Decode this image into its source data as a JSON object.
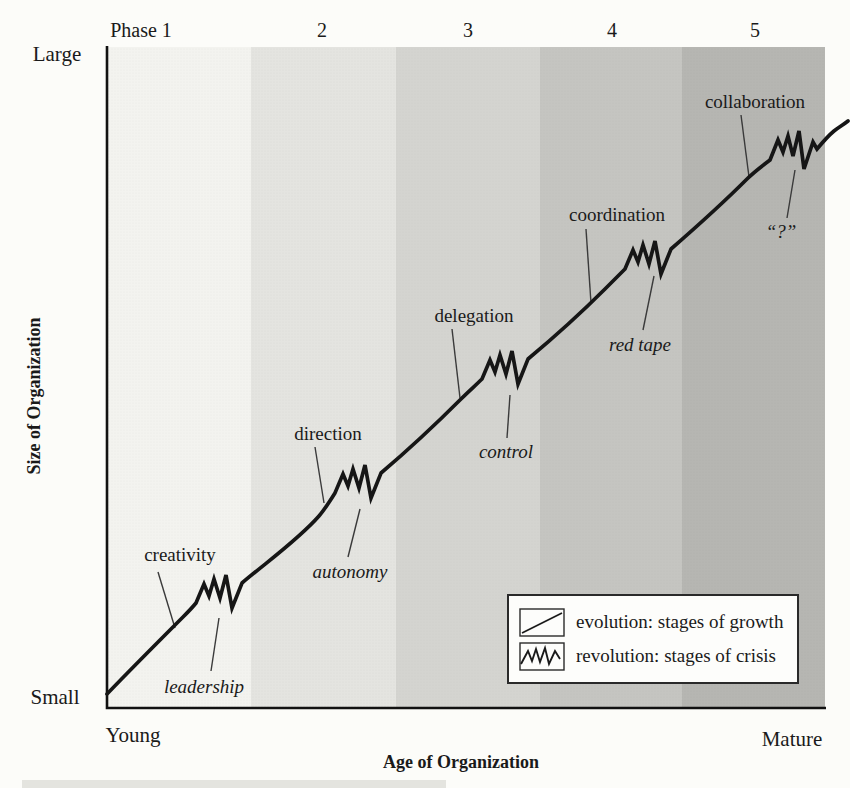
{
  "figure": {
    "y_axis": {
      "title": "Size of Organization",
      "max_label": "Large",
      "min_label": "Small"
    },
    "x_axis": {
      "title": "Age of Organization",
      "min_label": "Young",
      "max_label": "Mature"
    },
    "phase_header": [
      "Phase 1",
      "2",
      "3",
      "4",
      "5"
    ],
    "band_colors": [
      "#f3f3ef",
      "#e4e4e0",
      "#d4d4d0",
      "#c5c5c1",
      "#b6b6b2"
    ],
    "line_color": "#161616",
    "callout_color": "#3a3a3a",
    "evolution_stages": [
      "creativity",
      "direction",
      "delegation",
      "coordination",
      "collaboration"
    ],
    "revolution_crises": [
      "leadership",
      "autonomy",
      "control",
      "red tape",
      "“?”"
    ],
    "legend": [
      {
        "symbol": "evolution-line",
        "label": "evolution: stages of growth"
      },
      {
        "symbol": "revolution-zigzag",
        "label": "revolution: stages of crisis"
      }
    ]
  }
}
